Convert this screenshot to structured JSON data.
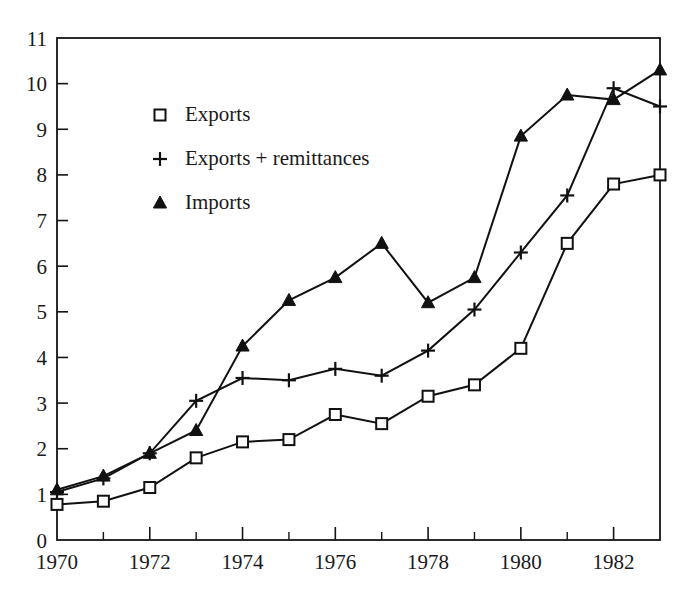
{
  "chart_data": {
    "type": "line",
    "title": "",
    "subtitle": "",
    "xlabel": "",
    "ylabel": "",
    "x": [
      1970,
      1971,
      1972,
      1973,
      1974,
      1975,
      1976,
      1977,
      1978,
      1979,
      1980,
      1981,
      1982,
      1983
    ],
    "xlim": [
      1970,
      1983
    ],
    "ylim": [
      0,
      11
    ],
    "grid": false,
    "legend_position": "upper-left-inside",
    "x_tick_labels": [
      "1970",
      "1972",
      "1974",
      "1976",
      "1978",
      "1980",
      "1982"
    ],
    "x_tick_values": [
      1970,
      1972,
      1974,
      1976,
      1978,
      1980,
      1982
    ],
    "x_minor_ticks": [
      1971,
      1973,
      1975,
      1977,
      1979,
      1981,
      1983
    ],
    "y_tick_labels": [
      "0",
      "1",
      "2",
      "3",
      "4",
      "5",
      "6",
      "7",
      "8",
      "9",
      "10",
      "11"
    ],
    "y_tick_values": [
      0,
      1,
      2,
      3,
      4,
      5,
      6,
      7,
      8,
      9,
      10,
      11
    ],
    "series": [
      {
        "name": "Exports",
        "marker": "open-square",
        "color": "#111111",
        "values": [
          0.78,
          0.85,
          1.15,
          1.8,
          2.15,
          2.2,
          2.75,
          2.55,
          3.15,
          3.4,
          4.2,
          6.5,
          7.8,
          8.0
        ]
      },
      {
        "name": "Exports + remittances",
        "marker": "plus",
        "color": "#111111",
        "values": [
          1.05,
          1.35,
          1.9,
          3.05,
          3.55,
          3.5,
          3.75,
          3.6,
          4.15,
          5.05,
          6.3,
          7.55,
          9.9,
          9.5
        ]
      },
      {
        "name": "Imports",
        "marker": "filled-triangle",
        "color": "#111111",
        "values": [
          1.1,
          1.4,
          1.9,
          2.4,
          4.25,
          5.25,
          5.75,
          6.5,
          5.2,
          5.75,
          8.85,
          9.75,
          9.65,
          10.3
        ]
      }
    ]
  },
  "legend": {
    "items": [
      {
        "label": "Exports",
        "marker": "open-square"
      },
      {
        "label": "Exports + remittances",
        "marker": "plus"
      },
      {
        "label": "Imports",
        "marker": "filled-triangle"
      }
    ]
  }
}
